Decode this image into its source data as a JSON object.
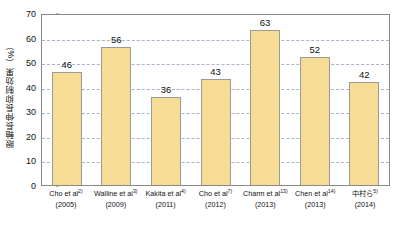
{
  "chart_data": {
    "type": "bar",
    "title": "",
    "xlabel": "",
    "ylabel": "眼軸長伸長抑制効果（%）",
    "ylim": [
      0,
      70
    ],
    "ytick_step": 10,
    "yticks": [
      70,
      60,
      50,
      40,
      30,
      20,
      10,
      0
    ],
    "grid": true,
    "legend": "none",
    "categories": [
      "Cho et al2)",
      "Walline et al3)",
      "Kakita et al4)",
      "Cho et al7)",
      "Charm et al13)",
      "Chen et al14)",
      "中村ら5)"
    ],
    "category_names": [
      "Cho et al",
      "Walline et al",
      "Kakita et al",
      "Cho et al",
      "Charm et al",
      "Chen et al",
      "中村ら"
    ],
    "category_refs": [
      "2)",
      "3)",
      "4)",
      "7)",
      "13)",
      "14)",
      "5)"
    ],
    "category_years": [
      "(2005)",
      "(2009)",
      "(2011)",
      "(2012)",
      "(2013)",
      "(2013)",
      "(2014)"
    ],
    "values": [
      46,
      56,
      36,
      43,
      63,
      52,
      42
    ],
    "value_labels": [
      "46",
      "56",
      "36",
      "43",
      "63",
      "52",
      "42"
    ]
  },
  "style": {
    "bar_fill": "#F7DC95",
    "bar_stroke": "#9A9A9A",
    "gridline_color": "#9AA7C4",
    "axis_color": "#8A8A8A",
    "text_color": "#111111",
    "background": "#FFFFFF"
  }
}
